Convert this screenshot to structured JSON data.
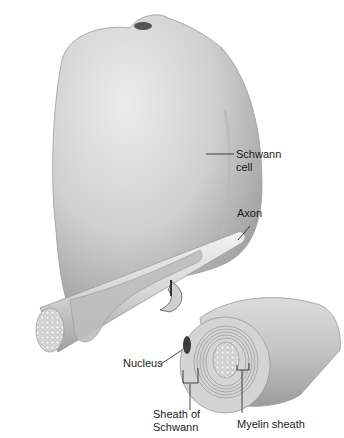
{
  "figure": {
    "labels": {
      "schwann_cell": "Schwann\ncell",
      "axon": "Axon",
      "nucleus": "Nucleus",
      "sheath_of_schwann": "Sheath of\nSchwann",
      "myelin_sheath": "Myelin sheath"
    },
    "colors": {
      "background": "#ffffff",
      "cell_light": "#e6e6e6",
      "cell_mid": "#bdbdbd",
      "cell_dark": "#8a8a8a",
      "nucleus": "#3c3c3c",
      "leader_line": "#1a1a1a"
    }
  }
}
